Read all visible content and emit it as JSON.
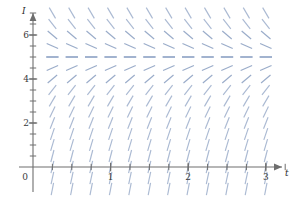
{
  "chart_data": {
    "type": "scatter",
    "plot_kind": "slope-field",
    "title": "",
    "xlabel": "t",
    "ylabel": "I",
    "xlim": [
      -0.22,
      3.42
    ],
    "ylim": [
      -1.55,
      7.9
    ],
    "xticks": [
      0,
      1,
      2,
      3
    ],
    "xtick_labels": [
      "0",
      "1",
      "2",
      "3"
    ],
    "yticks": [
      0,
      2,
      4,
      6
    ],
    "ytick_labels": [
      "0",
      "2",
      "4",
      "6"
    ],
    "minor_xtick_step": 0.25,
    "minor_ytick_step": 0.5,
    "grid": false,
    "legend": false,
    "equilibrium_value": 5,
    "slope_rule": "dI/dt = k*(5 - I)",
    "slope_constant": 3.0,
    "origin_label": "0",
    "segment_columns_t": [
      0.25,
      0.5,
      0.75,
      1.0,
      1.25,
      1.5,
      1.75,
      2.0,
      2.25,
      2.5,
      2.75,
      3.0
    ],
    "segment_rows_I": [
      -1.0,
      -0.5,
      0.0,
      0.5,
      1.0,
      1.5,
      2.0,
      2.5,
      3.0,
      3.5,
      4.0,
      4.5,
      5.0,
      5.5,
      6.0,
      6.5,
      7.0
    ],
    "segment_color": "#8fa3c4",
    "segment_color_near_equilibrium": "#7e95bd",
    "axis_color": "#6e6e6e",
    "text_color": "#3a3a3a",
    "background": "#ffffff"
  },
  "axes": {
    "x_axis_name": "t",
    "y_axis_name": "I"
  }
}
